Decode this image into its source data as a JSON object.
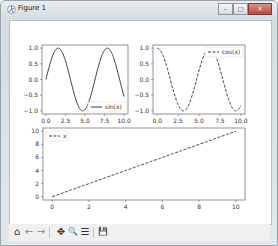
{
  "window": {
    "title": "Figure 1",
    "controls": {
      "minimize": "–",
      "maximize": "□",
      "close": "✕"
    }
  },
  "toolbar": {
    "buttons": [
      {
        "name": "home",
        "icon": "home-icon",
        "glyph": "⌂"
      },
      {
        "name": "back",
        "icon": "arrow-left-icon",
        "glyph": "←"
      },
      {
        "name": "forward",
        "icon": "arrow-right-icon",
        "glyph": "→"
      },
      {
        "name": "pan",
        "icon": "move-icon",
        "glyph": "✥"
      },
      {
        "name": "zoom",
        "icon": "magnifier-icon",
        "glyph": "🔍"
      },
      {
        "name": "subplots",
        "icon": "sliders-icon",
        "glyph": "☰"
      },
      {
        "name": "save",
        "icon": "floppy-icon",
        "glyph": "💾"
      }
    ]
  },
  "chart_data": [
    {
      "type": "line",
      "title": "",
      "series": [
        {
          "name": "sin(x)",
          "style": "solid",
          "function": "sin(x)"
        }
      ],
      "x_range": [
        0,
        10
      ],
      "xticks": [
        "0.0",
        "2.5",
        "5.0",
        "7.5",
        "10.0"
      ],
      "yticks": [
        "−1.0",
        "−0.5",
        "0.0",
        "0.5",
        "1.0"
      ],
      "ylim": [
        -1.1,
        1.1
      ],
      "legend": {
        "label": "sin(x)",
        "position": "lower right"
      }
    },
    {
      "type": "line",
      "title": "",
      "series": [
        {
          "name": "cos(x)",
          "style": "dashed",
          "function": "cos(x)"
        }
      ],
      "x_range": [
        0,
        10
      ],
      "xticks": [
        "0.0",
        "2.5",
        "5.0",
        "7.5",
        "10.0"
      ],
      "yticks": [
        "−1.0",
        "−0.5",
        "0.0",
        "0.5",
        "1.0"
      ],
      "ylim": [
        -1.1,
        1.1
      ],
      "legend": {
        "label": "cos(x)",
        "position": "upper right"
      }
    },
    {
      "type": "line",
      "title": "",
      "series": [
        {
          "name": "x",
          "style": "dashed",
          "function": "x",
          "x": [
            0,
            10
          ],
          "y": [
            0,
            10
          ]
        }
      ],
      "x_range": [
        0,
        10
      ],
      "xticks": [
        "0",
        "2",
        "4",
        "6",
        "8",
        "10"
      ],
      "yticks": [
        "0",
        "2",
        "4",
        "6",
        "8",
        "10"
      ],
      "ylim": [
        -0.5,
        10.5
      ],
      "legend": {
        "label": "x",
        "position": "upper left"
      }
    }
  ]
}
